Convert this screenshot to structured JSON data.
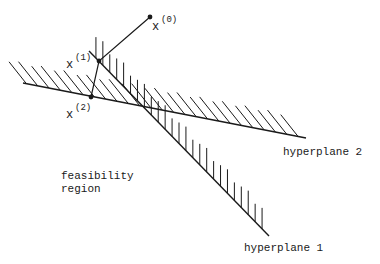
{
  "diagram": {
    "colors": {
      "ink": "#1a1a1a",
      "background": "#ffffff"
    },
    "hyperplanes": [
      {
        "id": "hyperplane-1",
        "label": "hyperplane 1",
        "start": [
          89,
          51
        ],
        "end": [
          269,
          236
        ],
        "hatch": "vertical-up",
        "label_pos": [
          244,
          251
        ]
      },
      {
        "id": "hyperplane-2",
        "label": "hyperplane 2",
        "start": [
          23,
          83
        ],
        "end": [
          306,
          138
        ],
        "hatch": "diagonal-up-left",
        "label_pos": [
          283,
          155
        ]
      }
    ],
    "points": [
      {
        "id": "x0",
        "base": "x",
        "superscript": "(0)",
        "pos": [
          150,
          17
        ],
        "label_pos": [
          152,
          30
        ]
      },
      {
        "id": "x1",
        "base": "x",
        "superscript": "(1)",
        "pos": [
          99,
          61
        ],
        "label_pos": [
          66,
          68
        ]
      },
      {
        "id": "x2",
        "base": "x",
        "superscript": "(2)",
        "pos": [
          91,
          97
        ],
        "label_pos": [
          66,
          118
        ]
      }
    ],
    "path": [
      [
        150,
        17
      ],
      [
        99,
        61
      ],
      [
        91,
        97
      ]
    ],
    "region_label": {
      "line1": "feasibility",
      "line2": "region",
      "pos": [
        61,
        179
      ]
    }
  }
}
